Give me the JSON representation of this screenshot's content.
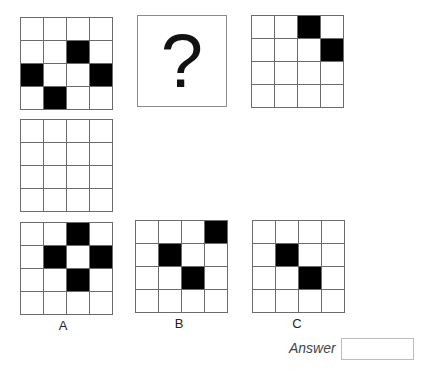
{
  "puzzle": {
    "question_mark": "?",
    "top_row": [
      {
        "id": "grid-1",
        "cells": [
          [
            0,
            0,
            0,
            0
          ],
          [
            0,
            0,
            1,
            0
          ],
          [
            1,
            0,
            0,
            1
          ],
          [
            0,
            1,
            0,
            0
          ]
        ]
      },
      {
        "id": "question-box"
      },
      {
        "id": "grid-3",
        "cells": [
          [
            0,
            0,
            1,
            0
          ],
          [
            0,
            0,
            0,
            1
          ],
          [
            0,
            0,
            0,
            0
          ],
          [
            0,
            0,
            0,
            0
          ]
        ]
      }
    ],
    "middle_row": [
      {
        "id": "grid-4",
        "cells": [
          [
            0,
            0,
            0,
            0
          ],
          [
            0,
            0,
            0,
            0
          ],
          [
            0,
            0,
            0,
            0
          ],
          [
            0,
            0,
            0,
            0
          ]
        ]
      }
    ],
    "options": [
      {
        "label": "A",
        "cells": [
          [
            0,
            0,
            1,
            0
          ],
          [
            0,
            1,
            0,
            1
          ],
          [
            0,
            0,
            1,
            0
          ],
          [
            0,
            0,
            0,
            0
          ]
        ]
      },
      {
        "label": "B",
        "cells": [
          [
            0,
            0,
            0,
            1
          ],
          [
            0,
            1,
            0,
            0
          ],
          [
            0,
            0,
            1,
            0
          ],
          [
            0,
            0,
            0,
            0
          ]
        ]
      },
      {
        "label": "C",
        "cells": [
          [
            0,
            0,
            0,
            0
          ],
          [
            0,
            1,
            0,
            0
          ],
          [
            0,
            0,
            1,
            0
          ],
          [
            0,
            0,
            0,
            0
          ]
        ]
      }
    ]
  },
  "answer": {
    "label": "Answer",
    "value": ""
  }
}
